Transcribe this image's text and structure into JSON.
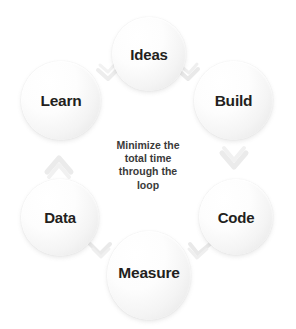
{
  "diagram": {
    "background_color": "#ffffff",
    "circle_fill_color": "#f2f2f2",
    "label_color": "#231f20",
    "center_text_color": "#3a3a3a",
    "arrow_color": "#e6e6e6"
  },
  "nodes": [
    {
      "id": "ideas",
      "label": "Ideas"
    },
    {
      "id": "build",
      "label": "Build"
    },
    {
      "id": "code",
      "label": "Code"
    },
    {
      "id": "measure",
      "label": "Measure"
    },
    {
      "id": "data",
      "label": "Data"
    },
    {
      "id": "learn",
      "label": "Learn"
    }
  ],
  "center_text": {
    "full": "Minimize the total time through the loop",
    "lines": [
      "Minimize the",
      "total time",
      "through the",
      "loop"
    ]
  },
  "arrows": [
    {
      "id": "ideas-to-build",
      "from": "Ideas",
      "to": "Build"
    },
    {
      "id": "build-to-code",
      "from": "Build",
      "to": "Code"
    },
    {
      "id": "code-to-measure",
      "from": "Code",
      "to": "Measure"
    },
    {
      "id": "measure-to-data",
      "from": "Measure",
      "to": "Data"
    },
    {
      "id": "data-to-learn",
      "from": "Data",
      "to": "Learn"
    },
    {
      "id": "learn-to-ideas",
      "from": "Learn",
      "to": "Ideas"
    }
  ]
}
